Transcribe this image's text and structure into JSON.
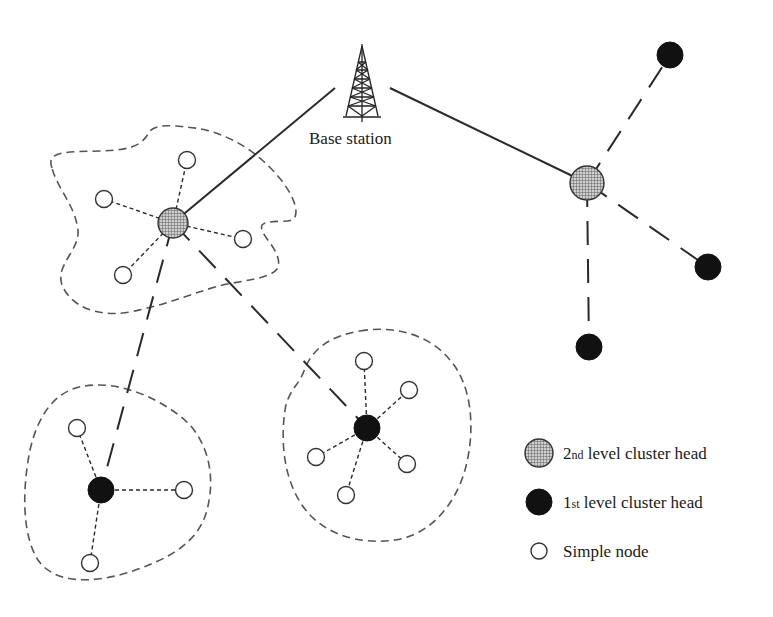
{
  "diagram": {
    "type": "hierarchical-cluster-wsn",
    "base_station": {
      "label": "Base station",
      "icon": "radio-tower-icon",
      "x": 362,
      "y": 82
    },
    "colors": {
      "stroke": "#2a2a2a",
      "boundary": "#555555",
      "first_level_fill": "#111111",
      "second_level_fill": "#9a9a9a",
      "simple_fill": "#ffffff"
    },
    "second_level_heads": [
      {
        "id": "L2A",
        "x": 173,
        "y": 223,
        "r": 15
      },
      {
        "id": "L2B",
        "x": 587,
        "y": 183,
        "r": 17
      }
    ],
    "first_level_heads": [
      {
        "id": "L1A",
        "x": 101,
        "y": 490,
        "r": 13,
        "parent": "L2A"
      },
      {
        "id": "L1B",
        "x": 367,
        "y": 428,
        "r": 13,
        "parent": "L2A"
      },
      {
        "id": "L1C",
        "x": 670,
        "y": 55,
        "r": 13,
        "parent": "L2B"
      },
      {
        "id": "L1D",
        "x": 708,
        "y": 267,
        "r": 13,
        "parent": "L2B"
      },
      {
        "id": "L1E",
        "x": 589,
        "y": 347,
        "r": 13,
        "parent": "L2B"
      }
    ],
    "simple_nodes": [
      {
        "head": "L2A",
        "x": 187,
        "y": 160
      },
      {
        "head": "L2A",
        "x": 104,
        "y": 199
      },
      {
        "head": "L2A",
        "x": 243,
        "y": 239
      },
      {
        "head": "L2A",
        "x": 123,
        "y": 275
      },
      {
        "head": "L1A",
        "x": 77,
        "y": 428
      },
      {
        "head": "L1A",
        "x": 184,
        "y": 490
      },
      {
        "head": "L1A",
        "x": 90,
        "y": 563
      },
      {
        "head": "L1B",
        "x": 364,
        "y": 361
      },
      {
        "head": "L1B",
        "x": 409,
        "y": 390
      },
      {
        "head": "L1B",
        "x": 316,
        "y": 457
      },
      {
        "head": "L1B",
        "x": 407,
        "y": 464
      },
      {
        "head": "L1B",
        "x": 346,
        "y": 495
      }
    ],
    "links": {
      "base_to_second_level": "solid",
      "second_to_first_level": "long-dash",
      "head_to_simple_node": "short-dash"
    }
  },
  "legend": {
    "items": [
      {
        "symbol": "second-level-cluster-head",
        "num": "2",
        "sup": "nd",
        "text": " level cluster head"
      },
      {
        "symbol": "first-level-cluster-head",
        "num": "1",
        "sup": "st",
        "text": " level cluster head"
      },
      {
        "symbol": "simple-node",
        "num": "",
        "sup": "",
        "text": "Simple node"
      }
    ]
  }
}
